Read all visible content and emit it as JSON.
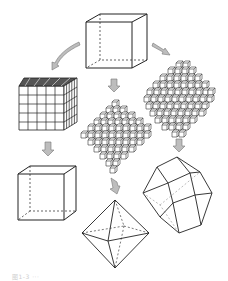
{
  "figure": {
    "nodes": [
      {
        "id": "unit-cube",
        "label": "unit cube"
      },
      {
        "id": "cube-stack",
        "label": "cube built from small cubes"
      },
      {
        "id": "octahedron-stack",
        "label": "octahedron built from small cubes"
      },
      {
        "id": "dodecahedron-stack",
        "label": "rhombic dodecahedron built from small cubes"
      },
      {
        "id": "cube",
        "label": "cube"
      },
      {
        "id": "octahedron",
        "label": "octahedron"
      },
      {
        "id": "rhombic-dodecahedron",
        "label": "rhombic dodecahedron"
      }
    ],
    "edges": [
      [
        "unit-cube",
        "cube-stack"
      ],
      [
        "unit-cube",
        "octahedron-stack"
      ],
      [
        "unit-cube",
        "dodecahedron-stack"
      ],
      [
        "cube-stack",
        "cube"
      ],
      [
        "octahedron-stack",
        "octahedron"
      ],
      [
        "dodecahedron-stack",
        "rhombic-dodecahedron"
      ]
    ],
    "colors": {
      "line": "#333333",
      "arrow_fill": "#bdbdbd",
      "cube_face": "#ffffff"
    }
  },
  "caption": "图1-3  ···"
}
